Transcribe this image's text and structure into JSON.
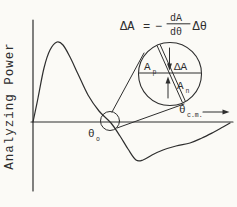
{
  "figure": {
    "colors": {
      "background": "#fbfaf6",
      "ink": "#2e2e2e"
    },
    "y_axis_label": "Analyzing Power",
    "equation": {
      "delta_a": "ΔA",
      "equals": "=",
      "minus": "−",
      "numerator": "dA",
      "denominator": "dθ",
      "delta_theta": "Δθ"
    },
    "labels": {
      "theta_zero": {
        "main": "θ",
        "sub": "o"
      },
      "theta_cm": {
        "main": "θ",
        "sub": "c.m."
      },
      "inset_ap": {
        "main": "A",
        "sub": "p"
      },
      "inset_delta_a": "ΔA",
      "inset_an": {
        "main": "A",
        "sub": "n"
      }
    }
  },
  "chart_data": {
    "type": "line",
    "ylabel": "Analyzing Power",
    "xlabel": "θ c.m.",
    "axes_numeric": false,
    "zero_crossing_label": "θ o",
    "annotation_equation": "ΔA = −(dA/dθ)Δθ",
    "curve_points": [
      [
        33,
        122
      ],
      [
        38,
        98
      ],
      [
        44,
        68
      ],
      [
        50,
        50
      ],
      [
        57,
        42
      ],
      [
        63,
        45
      ],
      [
        70,
        57
      ],
      [
        78,
        74
      ],
      [
        88,
        95
      ],
      [
        99,
        111
      ],
      [
        111,
        123
      ],
      [
        120,
        136
      ],
      [
        128,
        149
      ],
      [
        136,
        160
      ],
      [
        143,
        160
      ],
      [
        152,
        155
      ],
      [
        163,
        150
      ],
      [
        176,
        146
      ],
      [
        190,
        143
      ],
      [
        202,
        138
      ],
      [
        214,
        132
      ],
      [
        223,
        127
      ],
      [
        230,
        123
      ]
    ]
  }
}
